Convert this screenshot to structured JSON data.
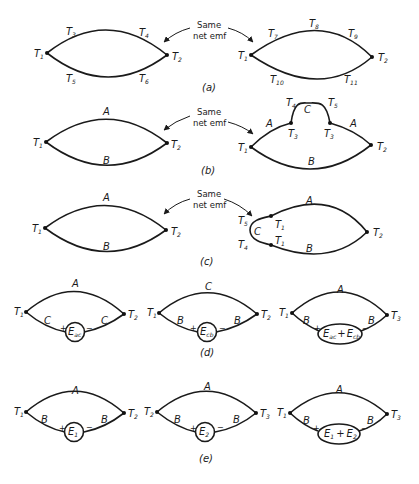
{
  "figure": {
    "note_label": "Same net emf",
    "note_line1": "Same",
    "note_line2": "net emf",
    "captions": {
      "a": "(a)",
      "b": "(b)",
      "c": "(c)",
      "d": "(d)",
      "e": "(e)"
    },
    "panel_a": {
      "left": {
        "junctions": [
          "T1",
          "T2"
        ],
        "upper_labels": [
          "T3",
          "T4"
        ],
        "lower_labels": [
          "T5",
          "T6"
        ]
      },
      "right": {
        "junctions": [
          "T1",
          "T2"
        ],
        "upper_labels": [
          "T7",
          "T8",
          "T9"
        ],
        "lower_labels": [
          "T10",
          "T11"
        ]
      }
    },
    "panel_b": {
      "left": {
        "junctions": [
          "T1",
          "T2"
        ],
        "upper_wire": "A",
        "lower_wire": "B"
      },
      "right": {
        "junctions": [
          "T1",
          "T2",
          "T3",
          "T3"
        ],
        "upper_wire_left": "A",
        "upper_wire_right": "A",
        "loop_wire": "C",
        "loop_labels": [
          "T4",
          "T5"
        ],
        "lower_wire": "B"
      }
    },
    "panel_c": {
      "left": {
        "junctions": [
          "T1",
          "T2"
        ],
        "upper_wire": "A",
        "lower_wire": "B"
      },
      "right": {
        "junctions": [
          "T1",
          "T1",
          "T2"
        ],
        "upper_wire": "A",
        "lower_wire": "B",
        "loop_wire": "C",
        "loop_labels": [
          "T5",
          "T4"
        ]
      }
    },
    "panel_d": [
      {
        "junctions": [
          "T1",
          "T2"
        ],
        "upper_wire": "A",
        "lower_wire_left": "C",
        "lower_wire_right": "C",
        "source": "E_ac",
        "source_main": "E",
        "source_sub": "ac",
        "plus": "+",
        "minus": "−"
      },
      {
        "junctions": [
          "T1",
          "T2"
        ],
        "upper_wire": "C",
        "lower_wire_left": "B",
        "lower_wire_right": "B",
        "source": "E_cb",
        "source_main": "E",
        "source_sub": "cb",
        "plus": "+",
        "minus": "−"
      },
      {
        "junctions": [
          "T1",
          "T2"
        ],
        "upper_wire": "A",
        "lower_wire_left": "B",
        "lower_wire_right": "B",
        "source": "E_ac + E_cb",
        "source_main1": "E",
        "source_sub1": "ac",
        "source_op": "+",
        "source_main2": "E",
        "source_sub2": "cb",
        "plus": "+",
        "minus": "−"
      }
    ],
    "panel_e": [
      {
        "junctions": [
          "T1",
          "T2"
        ],
        "upper_wire": "A",
        "lower_wire_left": "B",
        "lower_wire_right": "B",
        "source": "E_1",
        "source_main": "E",
        "source_sub": "1",
        "plus": "+",
        "minus": "−"
      },
      {
        "junctions": [
          "T2",
          "T3"
        ],
        "upper_wire": "A",
        "lower_wire_left": "B",
        "lower_wire_right": "B",
        "source": "E_2",
        "source_main": "E",
        "source_sub": "2",
        "plus": "+",
        "minus": "−"
      },
      {
        "junctions": [
          "T1",
          "T3"
        ],
        "upper_wire": "A",
        "lower_wire_left": "B",
        "lower_wire_right": "B",
        "source": "E_1 + E_2",
        "source_main1": "E",
        "source_sub1": "1",
        "source_op": "+",
        "source_main2": "E",
        "source_sub2": "2",
        "plus": "+",
        "minus": "−"
      }
    ],
    "letters": {
      "T": "T",
      "A": "A",
      "B": "B",
      "C": "C"
    },
    "subs": {
      "1": "1",
      "2": "2",
      "3": "3",
      "4": "4",
      "5": "5",
      "6": "6",
      "7": "7",
      "8": "8",
      "9": "9",
      "10": "10",
      "11": "11"
    }
  }
}
